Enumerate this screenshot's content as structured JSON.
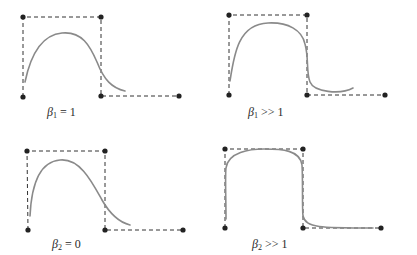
{
  "figure": {
    "colors": {
      "curve": "#8a8a8a",
      "control_polygon": "#333333",
      "control_point": "#222222",
      "label_text": "#2a2a2a",
      "background": "#ffffff"
    },
    "panels": [
      {
        "id": "beta1-equals-1",
        "label": {
          "symbol": "β",
          "subscript": "1",
          "relation": " = 1"
        },
        "label_pos": [
          47,
          106
        ],
        "control_points": [
          [
            23,
            97
          ],
          [
            23,
            17
          ],
          [
            101,
            17
          ],
          [
            101,
            96
          ],
          [
            179,
            96
          ]
        ],
        "curve_path": "M25,82 C30,58 40,35 62,33 C82,31 90,46 97,62 C104,80 112,88 125,91"
      },
      {
        "id": "beta1-much-greater-1",
        "label": {
          "symbol": "β",
          "subscript": "1",
          "relation": " >> 1"
        },
        "label_pos": [
          248,
          106
        ],
        "control_points": [
          [
            229,
            95
          ],
          [
            229,
            15
          ],
          [
            307,
            15
          ],
          [
            307,
            95
          ],
          [
            385,
            95
          ]
        ],
        "curve_path": "M230,81 C234,55 238,24 268,23 C288,22 302,30 305,44 C309,58 306,72 310,82 C314,92 340,95 353,88"
      },
      {
        "id": "beta2-equals-0",
        "label": {
          "symbol": "β",
          "subscript": "2",
          "relation": " = 0"
        },
        "label_pos": [
          52,
          238
        ],
        "control_points": [
          [
            28,
            230
          ],
          [
            27,
            151
          ],
          [
            105,
            151
          ],
          [
            105,
            230
          ],
          [
            183,
            230
          ]
        ],
        "curve_path": "M30,216 C31,195 35,162 60,160 C80,158 92,182 102,200 C110,214 118,222 130,225"
      },
      {
        "id": "beta2-much-greater-1",
        "label": {
          "symbol": "β",
          "subscript": "2",
          "relation": " >> 1"
        },
        "label_pos": [
          252,
          238
        ],
        "control_points": [
          [
            225,
            228
          ],
          [
            225,
            149
          ],
          [
            303,
            149
          ],
          [
            303,
            228
          ],
          [
            381,
            228
          ]
        ],
        "curve_path": "M226,219 C226,200 225,175 226,168 C228,152 250,149 264,149 C282,149 300,150 302,165 C303,180 302,208 303,216 C306,228 320,228 373,228"
      }
    ]
  }
}
